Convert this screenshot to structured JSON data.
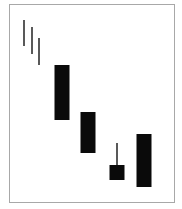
{
  "chart_data": {
    "type": "candlestick",
    "title": "",
    "xlabel": "",
    "ylabel": "",
    "grid": false,
    "legend": null,
    "note": "Unlabeled schematic candlestick pattern; values are pixel-derived relative prices (higher = higher price).",
    "candles": [
      {
        "x": 24,
        "type": "line",
        "high": 189,
        "low": 163
      },
      {
        "x": 32,
        "type": "line",
        "high": 182,
        "low": 155
      },
      {
        "x": 39,
        "type": "line",
        "high": 171,
        "low": 144
      },
      {
        "x": 62,
        "type": "bearish",
        "open": 144,
        "close": 89,
        "high": 144,
        "low": 89
      },
      {
        "x": 88,
        "type": "bearish",
        "open": 97,
        "close": 56,
        "high": 97,
        "low": 56
      },
      {
        "x": 117,
        "type": "bearish",
        "open": 44,
        "close": 29,
        "high": 66,
        "low": 29
      },
      {
        "x": 144,
        "type": "bearish",
        "open": 75,
        "close": 22,
        "high": 75,
        "low": 22
      }
    ]
  }
}
